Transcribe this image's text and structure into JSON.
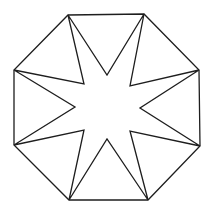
{
  "figure": {
    "stroke_color": "#1e1e1e",
    "background": "#ffffff",
    "octagon_vertices": [
      [
        68,
        15
      ],
      [
        144,
        14
      ],
      [
        199,
        70
      ],
      [
        200,
        146
      ],
      [
        148,
        200
      ],
      [
        69,
        200
      ],
      [
        14,
        145
      ],
      [
        14,
        70
      ]
    ],
    "star_inner_vertices": [
      [
        107,
        75
      ],
      [
        130,
        86
      ],
      [
        140,
        108
      ],
      [
        130,
        131
      ],
      [
        107,
        139
      ],
      [
        84,
        130
      ],
      [
        75,
        107
      ],
      [
        84,
        84
      ]
    ]
  }
}
